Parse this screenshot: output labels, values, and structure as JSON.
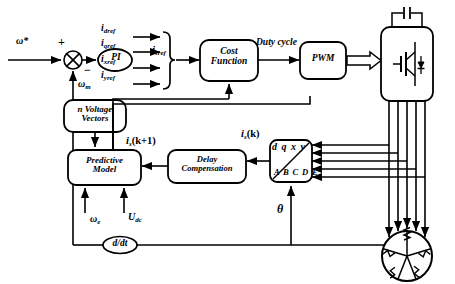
{
  "diagram": {
    "background_color": "#ffffff",
    "line_color": "#000000"
  },
  "inputs": {
    "speed_reference": "ω*",
    "plus_sign": "+",
    "minus_sign": "−",
    "speed_feedback": "ω",
    "speed_feedback_sub": "m",
    "electrical_speed": "ω",
    "electrical_speed_sub": "e",
    "dc_voltage": "U",
    "dc_voltage_sub": "dc",
    "theta": "θ"
  },
  "blocks": {
    "pi": "PI",
    "cost_function_line1": "Cost",
    "cost_function_line2": "Function",
    "pwm": "PWM",
    "voltage_vectors_line1": "n Voltage",
    "voltage_vectors_line2": "Vectors",
    "predictive_model_line1": "Predictive",
    "predictive_model_line2": "Model",
    "delay_comp_line1": "Delay",
    "delay_comp_line2": "Compensation",
    "derivative": "d/dt",
    "transform_top": "d q x y",
    "transform_bottom": "A B C D E",
    "inverter": "inverter-igbt-bridge",
    "machine": "five-phase-machine"
  },
  "signals": {
    "i_dref": {
      "base": "i",
      "sub": "dref"
    },
    "i_qref": {
      "base": "i",
      "sub": "qref"
    },
    "i_xref": {
      "base": "i",
      "sub": "xref"
    },
    "i_yref": {
      "base": "i",
      "sub": "yref"
    },
    "i_sref": {
      "base": "i",
      "sub": "sref"
    },
    "duty_cycle": "Duty cycle",
    "is_k_plus_1": {
      "base": "i",
      "sub": "s",
      "arg": "(k+1)"
    },
    "is_k": {
      "base": "i",
      "sub": "s",
      "arg": "(k)"
    }
  },
  "icons": {
    "sum_junction": "summing-junction-icon",
    "igbt": "igbt-transistor-icon",
    "capacitor": "dc-link-capacitor-icon",
    "motor": "star-winding-motor-icon"
  }
}
